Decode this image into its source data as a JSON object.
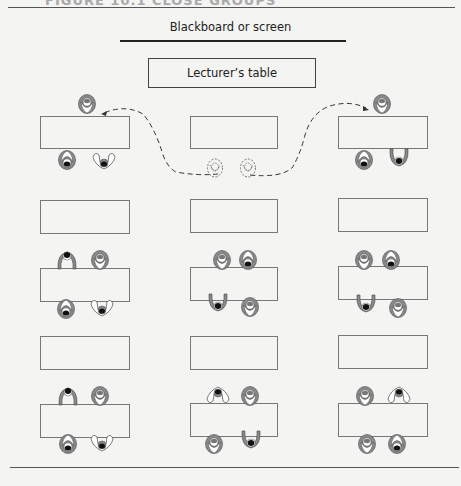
{
  "header": {
    "cut_off_text": "FIGURE 10.1 CLOSE GROUPS"
  },
  "board": {
    "label": "Blackboard or screen"
  },
  "lecturer_table": {
    "label": "Lecturer’s table"
  },
  "colors": {
    "table_border": "#777777",
    "person_shell": "#8a8a8a",
    "person_light": "#ffffff",
    "hair_dark": "#111111",
    "background": "#f4f4f2"
  },
  "tables": [
    {
      "row": 1,
      "col": 1,
      "x": 40,
      "y": 116,
      "w": 90,
      "h": 33,
      "occupied": true
    },
    {
      "row": 1,
      "col": 2,
      "x": 190,
      "y": 116,
      "w": 88,
      "h": 33,
      "occupied": false,
      "note": "students moved (dashed)"
    },
    {
      "row": 1,
      "col": 3,
      "x": 338,
      "y": 116,
      "w": 90,
      "h": 33,
      "occupied": true
    },
    {
      "row": 2,
      "col": 1,
      "x": 40,
      "y": 200,
      "w": 90,
      "h": 34,
      "occupied": false
    },
    {
      "row": 2,
      "col": 2,
      "x": 190,
      "y": 199,
      "w": 88,
      "h": 34,
      "occupied": false
    },
    {
      "row": 2,
      "col": 3,
      "x": 338,
      "y": 198,
      "w": 90,
      "h": 34,
      "occupied": false
    },
    {
      "row": 3,
      "col": 1,
      "x": 40,
      "y": 268,
      "w": 90,
      "h": 34,
      "occupied": true
    },
    {
      "row": 3,
      "col": 2,
      "x": 190,
      "y": 267,
      "w": 88,
      "h": 34,
      "occupied": true
    },
    {
      "row": 3,
      "col": 3,
      "x": 338,
      "y": 266,
      "w": 90,
      "h": 34,
      "occupied": true
    },
    {
      "row": 4,
      "col": 1,
      "x": 40,
      "y": 336,
      "w": 90,
      "h": 34,
      "occupied": false
    },
    {
      "row": 4,
      "col": 2,
      "x": 190,
      "y": 336,
      "w": 88,
      "h": 34,
      "occupied": false
    },
    {
      "row": 4,
      "col": 3,
      "x": 338,
      "y": 335,
      "w": 90,
      "h": 34,
      "occupied": false
    },
    {
      "row": 5,
      "col": 1,
      "x": 40,
      "y": 404,
      "w": 90,
      "h": 34,
      "occupied": true
    },
    {
      "row": 5,
      "col": 2,
      "x": 190,
      "y": 403,
      "w": 88,
      "h": 34,
      "occupied": true
    },
    {
      "row": 5,
      "col": 3,
      "x": 338,
      "y": 403,
      "w": 90,
      "h": 34,
      "occupied": true
    }
  ]
}
